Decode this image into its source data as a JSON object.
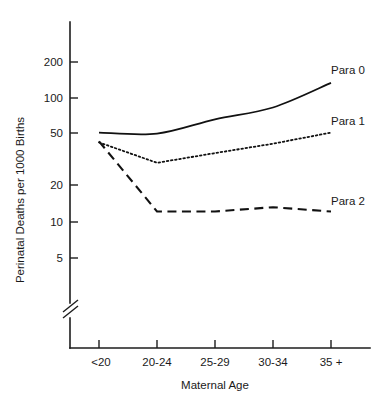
{
  "chart_data": {
    "type": "line",
    "title": "",
    "xlabel": "Maternal Age",
    "ylabel": "Perinatal Deaths per 1000 Births",
    "categories": [
      "<20",
      "20-24",
      "25-29",
      "30-34",
      "35 +"
    ],
    "yscale": "log",
    "yticks": [
      5,
      10,
      20,
      50,
      100,
      200
    ],
    "ytick_labels": [
      "5",
      "10",
      "20",
      "50",
      "100",
      "200"
    ],
    "ylim": [
      5,
      260
    ],
    "axis_break": true,
    "grid": false,
    "legend_position": "right-inline",
    "series": [
      {
        "name": "Para 0",
        "style": "solid",
        "values": [
          53,
          52,
          68,
          85,
          135
        ]
      },
      {
        "name": "Para 1",
        "style": "dotted",
        "values": [
          44,
          30,
          36,
          43,
          53
        ]
      },
      {
        "name": "Para 2",
        "style": "dashed",
        "values": [
          45,
          12,
          12,
          13,
          12
        ]
      }
    ],
    "colors": {
      "line": "#111111",
      "axis": "#1d1d1d",
      "background": "#ffffff"
    }
  },
  "annotations": {
    "para0_label": "Para 0",
    "para1_label": "Para 1",
    "para2_label": "Para 2"
  }
}
